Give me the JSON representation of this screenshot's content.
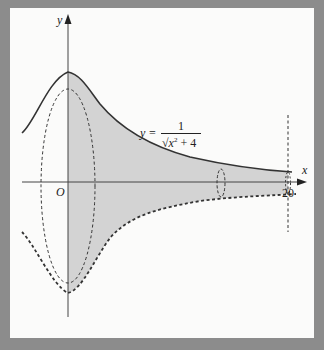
{
  "figure": {
    "type": "solid-of-revolution-diagram",
    "axes": {
      "x_label": "x",
      "y_label": "y",
      "origin_label": "O",
      "x_tick_label": "20"
    },
    "curve": {
      "equation_lhs": "y =",
      "numerator": "1",
      "denominator_sqrt": "√",
      "denominator_var": "x",
      "denominator_exp": "2",
      "denominator_rest": " + 4",
      "function": "y = 1/sqrt(x^2 + 4)",
      "peak_value": 0.5
    },
    "region": {
      "x_from": 0,
      "x_to": 20,
      "shading": "#d3d3d3",
      "revolved_about": "x-axis"
    },
    "colors": {
      "frame": "#8c8c8c",
      "panel": "#fbfbfa",
      "curve": "#333333",
      "shade": "#d3d3d3"
    }
  }
}
